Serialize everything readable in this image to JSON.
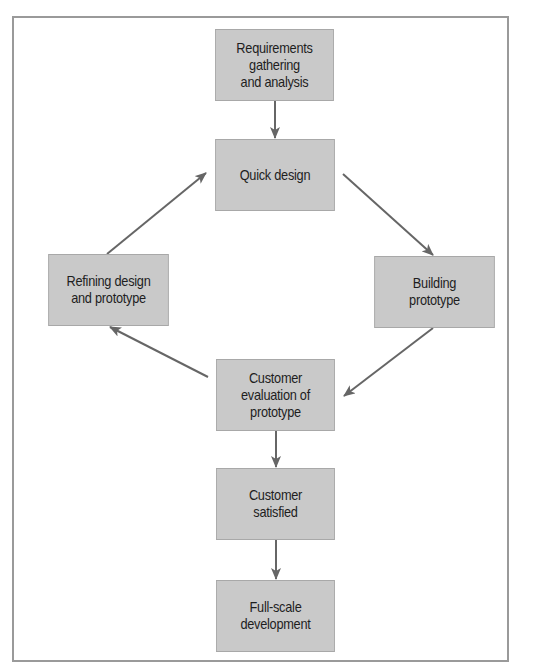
{
  "diagram": {
    "type": "flowchart",
    "title": "",
    "colors": {
      "frame_border": "#9a9a9a",
      "node_fill": "#c9c9c9",
      "node_border": "#a8a8a8",
      "arrow": "#666666",
      "text": "#1e1e1e"
    },
    "nodes": [
      {
        "id": "requirements",
        "label": "Requirements\ngathering\nand analysis",
        "x": 207,
        "y": 29,
        "w": 135,
        "h": 72
      },
      {
        "id": "quick_design",
        "label": "Quick design",
        "x": 207,
        "y": 139,
        "w": 136,
        "h": 72
      },
      {
        "id": "refining",
        "label": "Refining design\nand prototype",
        "x": 40,
        "y": 254,
        "w": 137,
        "h": 72
      },
      {
        "id": "building",
        "label": "Building\nprototype",
        "x": 366,
        "y": 256,
        "w": 137,
        "h": 72
      },
      {
        "id": "evaluation",
        "label": "Customer\nevaluation of\nprototype",
        "x": 208,
        "y": 359,
        "w": 135,
        "h": 72
      },
      {
        "id": "satisfied",
        "label": "Customer\nsatisfied",
        "x": 208,
        "y": 468,
        "w": 135,
        "h": 72
      },
      {
        "id": "full_scale",
        "label": "Full-scale\ndevelopment",
        "x": 208,
        "y": 580,
        "w": 135,
        "h": 72
      }
    ],
    "edges": [
      {
        "from": "requirements",
        "to": "quick_design"
      },
      {
        "from": "quick_design",
        "to": "building"
      },
      {
        "from": "building",
        "to": "evaluation"
      },
      {
        "from": "evaluation",
        "to": "refining"
      },
      {
        "from": "refining",
        "to": "quick_design"
      },
      {
        "from": "evaluation",
        "to": "satisfied"
      },
      {
        "from": "satisfied",
        "to": "full_scale"
      }
    ]
  }
}
